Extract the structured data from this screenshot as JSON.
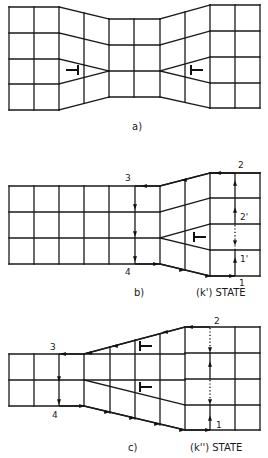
{
  "panels": [
    {
      "id": "a",
      "caption": "a)",
      "caption_pos": [
        132,
        130
      ],
      "lines": [
        [
          9,
          7,
          59,
          7
        ],
        [
          9,
          33,
          59,
          33
        ],
        [
          9,
          59,
          59,
          59
        ],
        [
          9,
          84,
          59,
          84
        ],
        [
          9,
          110,
          59,
          110
        ],
        [
          9,
          7,
          9,
          110
        ],
        [
          34,
          7,
          34,
          110
        ],
        [
          59,
          7,
          59,
          110
        ],
        [
          59,
          7,
          109,
          19
        ],
        [
          59,
          33,
          109,
          45
        ],
        [
          59,
          59,
          109,
          71
        ],
        [
          59,
          84,
          109,
          71
        ],
        [
          59,
          110,
          109,
          97
        ],
        [
          84,
          13,
          84,
          103
        ],
        [
          109,
          19,
          109,
          97
        ],
        [
          109,
          19,
          160,
          19
        ],
        [
          109,
          45,
          160,
          45
        ],
        [
          109,
          71,
          160,
          71
        ],
        [
          109,
          97,
          160,
          97
        ],
        [
          134,
          19,
          134,
          97
        ],
        [
          160,
          19,
          160,
          97
        ],
        [
          160,
          19,
          210,
          5
        ],
        [
          160,
          45,
          210,
          31
        ],
        [
          160,
          71,
          210,
          57
        ],
        [
          160,
          71,
          210,
          83
        ],
        [
          160,
          97,
          210,
          108
        ],
        [
          185,
          12,
          185,
          102
        ],
        [
          210,
          5,
          260,
          5
        ],
        [
          210,
          31,
          260,
          31
        ],
        [
          210,
          57,
          260,
          57
        ],
        [
          210,
          83,
          260,
          83
        ],
        [
          210,
          108,
          260,
          108
        ],
        [
          210,
          5,
          210,
          108
        ],
        [
          235,
          5,
          235,
          108
        ],
        [
          260,
          5,
          260,
          108
        ]
      ],
      "dislocations": [
        {
          "x": 78,
          "y": 70,
          "orient": "right"
        },
        {
          "x": 191,
          "y": 70,
          "orient": "left"
        }
      ],
      "path_segments": [],
      "labels": []
    },
    {
      "id": "b",
      "caption": "b)",
      "caption_pos": [
        134,
        296
      ],
      "state_label": "(k') STATE",
      "state_pos": [
        196,
        296
      ],
      "lines": [
        [
          9,
          186,
          160,
          186
        ],
        [
          9,
          212,
          160,
          212
        ],
        [
          9,
          238,
          160,
          238
        ],
        [
          9,
          264,
          160,
          264
        ],
        [
          9,
          186,
          9,
          264
        ],
        [
          34,
          186,
          34,
          264
        ],
        [
          59,
          186,
          59,
          264
        ],
        [
          84,
          186,
          84,
          264
        ],
        [
          109,
          186,
          109,
          264
        ],
        [
          160,
          186,
          160,
          264
        ],
        [
          160,
          186,
          210,
          173
        ],
        [
          160,
          212,
          210,
          198
        ],
        [
          160,
          238,
          210,
          224
        ],
        [
          160,
          238,
          210,
          250
        ],
        [
          160,
          264,
          210,
          276
        ],
        [
          185,
          180,
          185,
          270
        ],
        [
          210,
          173,
          260,
          173
        ],
        [
          210,
          198,
          260,
          198
        ],
        [
          210,
          224,
          260,
          224
        ],
        [
          210,
          250,
          260,
          250
        ],
        [
          210,
          276,
          260,
          276
        ],
        [
          210,
          173,
          260,
          173
        ],
        [
          210,
          173,
          210,
          276
        ],
        [
          260,
          173,
          260,
          276
        ]
      ],
      "path_segments": [
        {
          "type": "solid",
          "points": [
            [
              235,
              276
            ],
            [
              235,
              250
            ]
          ]
        },
        {
          "type": "dotted",
          "points": [
            [
              235,
              250
            ],
            [
              235,
              224
            ]
          ]
        },
        {
          "type": "solid",
          "points": [
            [
              235,
              224
            ],
            [
              235,
              173
            ]
          ]
        },
        {
          "type": "solid",
          "points": [
            [
              235,
              173
            ],
            [
              210,
              173
            ],
            [
              160,
              186
            ],
            [
              135,
              186
            ]
          ]
        },
        {
          "type": "solid",
          "points": [
            [
              135,
              186
            ],
            [
              135,
              264
            ]
          ]
        },
        {
          "type": "solid",
          "points": [
            [
              135,
              264
            ],
            [
              160,
              264
            ],
            [
              210,
              276
            ],
            [
              235,
              276
            ]
          ]
        }
      ],
      "arrows": [
        {
          "x": 235,
          "y": 260,
          "dir": "up"
        },
        {
          "x": 235,
          "y": 210,
          "dir": "up"
        },
        {
          "x": 235,
          "y": 183,
          "dir": "up"
        },
        {
          "x": 235,
          "y": 243,
          "dir": "down"
        },
        {
          "x": 218,
          "y": 173,
          "dir": "left"
        },
        {
          "x": 184,
          "y": 180,
          "dir": "left"
        },
        {
          "x": 144,
          "y": 186,
          "dir": "left"
        },
        {
          "x": 135,
          "y": 207,
          "dir": "down"
        },
        {
          "x": 135,
          "y": 234,
          "dir": "down"
        },
        {
          "x": 135,
          "y": 259,
          "dir": "down"
        },
        {
          "x": 156,
          "y": 264,
          "dir": "right"
        },
        {
          "x": 182,
          "y": 270,
          "dir": "right"
        },
        {
          "x": 208,
          "y": 276,
          "dir": "right"
        },
        {
          "x": 232,
          "y": 276,
          "dir": "right"
        }
      ],
      "dislocations": [
        {
          "x": 194,
          "y": 237,
          "orient": "left"
        }
      ],
      "labels": [
        {
          "text": "2",
          "x": 238,
          "y": 168
        },
        {
          "text": "2'",
          "x": 240,
          "y": 220
        },
        {
          "text": "1'",
          "x": 240,
          "y": 262
        },
        {
          "text": "1",
          "x": 239,
          "y": 286
        },
        {
          "text": "3",
          "x": 125,
          "y": 181
        },
        {
          "text": "4",
          "x": 125,
          "y": 275
        }
      ]
    },
    {
      "id": "c",
      "caption": "c)",
      "caption_pos": [
        128,
        451
      ],
      "state_label": "(k'') STATE",
      "state_pos": [
        190,
        451
      ],
      "lines": [
        [
          9,
          354,
          84,
          354
        ],
        [
          9,
          380,
          84,
          380
        ],
        [
          9,
          406,
          84,
          406
        ],
        [
          9,
          354,
          9,
          406
        ],
        [
          34,
          354,
          34,
          406
        ],
        [
          84,
          354,
          84,
          406
        ],
        [
          84,
          354,
          185,
          327
        ],
        [
          84,
          354,
          185,
          354
        ],
        [
          84,
          380,
          185,
          380
        ],
        [
          84,
          380,
          185,
          405
        ],
        [
          84,
          406,
          185,
          430
        ],
        [
          110,
          347,
          110,
          413
        ],
        [
          135,
          340,
          135,
          419
        ],
        [
          160,
          334,
          160,
          425
        ],
        [
          185,
          327,
          185,
          430
        ],
        [
          185,
          327,
          260,
          327
        ],
        [
          185,
          353,
          260,
          353
        ],
        [
          185,
          379,
          260,
          379
        ],
        [
          185,
          405,
          260,
          405
        ],
        [
          185,
          430,
          260,
          430
        ],
        [
          235,
          327,
          235,
          430
        ],
        [
          260,
          327,
          260,
          430
        ]
      ],
      "path_segments": [
        {
          "type": "solid",
          "points": [
            [
              210,
              430
            ],
            [
              210,
              405
            ]
          ]
        },
        {
          "type": "dotted",
          "points": [
            [
              210,
              405
            ],
            [
              210,
              379
            ]
          ]
        },
        {
          "type": "solid",
          "points": [
            [
              210,
              379
            ],
            [
              210,
              353
            ]
          ]
        },
        {
          "type": "dotted",
          "points": [
            [
              210,
              353
            ],
            [
              210,
              327
            ]
          ]
        },
        {
          "type": "solid",
          "points": [
            [
              210,
              327
            ],
            [
              185,
              327
            ],
            [
              84,
              354
            ],
            [
              59,
              354
            ]
          ]
        },
        {
          "type": "solid",
          "points": [
            [
              59,
              354
            ],
            [
              59,
              406
            ]
          ]
        },
        {
          "type": "solid",
          "points": [
            [
              59,
              406
            ],
            [
              84,
              406
            ],
            [
              185,
              430
            ],
            [
              210,
              430
            ]
          ]
        }
      ],
      "arrows": [
        {
          "x": 210,
          "y": 418,
          "dir": "up"
        },
        {
          "x": 210,
          "y": 402,
          "dir": "down"
        },
        {
          "x": 210,
          "y": 364,
          "dir": "up"
        },
        {
          "x": 210,
          "y": 350,
          "dir": "down"
        },
        {
          "x": 190,
          "y": 327,
          "dir": "left"
        },
        {
          "x": 165,
          "y": 332,
          "dir": "left"
        },
        {
          "x": 115,
          "y": 346,
          "dir": "left"
        },
        {
          "x": 89,
          "y": 353,
          "dir": "left"
        },
        {
          "x": 63,
          "y": 354,
          "dir": "left"
        },
        {
          "x": 59,
          "y": 379,
          "dir": "down"
        },
        {
          "x": 59,
          "y": 402,
          "dir": "down"
        },
        {
          "x": 82,
          "y": 406,
          "dir": "right"
        },
        {
          "x": 107,
          "y": 412,
          "dir": "right"
        },
        {
          "x": 132,
          "y": 418,
          "dir": "right"
        },
        {
          "x": 157,
          "y": 424,
          "dir": "right"
        },
        {
          "x": 182,
          "y": 430,
          "dir": "right"
        },
        {
          "x": 208,
          "y": 430,
          "dir": "right"
        }
      ],
      "dislocations": [
        {
          "x": 140,
          "y": 346,
          "orient": "left"
        },
        {
          "x": 140,
          "y": 387,
          "orient": "left"
        }
      ],
      "labels": [
        {
          "text": "2",
          "x": 214,
          "y": 324
        },
        {
          "text": "1",
          "x": 216,
          "y": 428
        },
        {
          "text": "3",
          "x": 50,
          "y": 350
        },
        {
          "text": "4",
          "x": 52,
          "y": 418
        }
      ]
    }
  ]
}
